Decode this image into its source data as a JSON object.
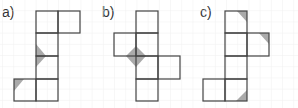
{
  "figures": [
    {
      "label": "a)"
    },
    {
      "label": "b)"
    },
    {
      "label": "c)"
    }
  ],
  "colors": {
    "grid": "#e6e6e6",
    "edge": "#444444",
    "shade": "#999999"
  }
}
